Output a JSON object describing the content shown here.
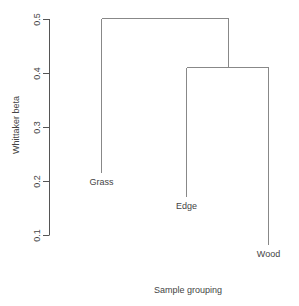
{
  "chart_data": {
    "type": "dendrogram",
    "title": "",
    "xlabel": "Sample grouping",
    "ylabel": "Whittaker beta",
    "ylim": [
      0.08,
      0.5
    ],
    "y_ticks": [
      0.1,
      0.2,
      0.3,
      0.4,
      0.5
    ],
    "y_tick_labels": [
      "0.1",
      "0.2",
      "0.3",
      "0.4",
      "0.5"
    ],
    "grid": false,
    "leaves": [
      {
        "label": "Grass",
        "order": 1,
        "label_height": 0.215
      },
      {
        "label": "Edge",
        "order": 2,
        "label_height": 0.17
      },
      {
        "label": "Wood",
        "order": 3,
        "label_height": 0.081
      }
    ],
    "merges": [
      {
        "members": [
          "Edge",
          "Wood"
        ],
        "height": 0.411
      },
      {
        "members": [
          "Grass",
          "Edge+Wood"
        ],
        "height": 0.502
      }
    ],
    "colors": {
      "branches": "#888888",
      "axis": "#555555",
      "text": "#444444"
    }
  }
}
